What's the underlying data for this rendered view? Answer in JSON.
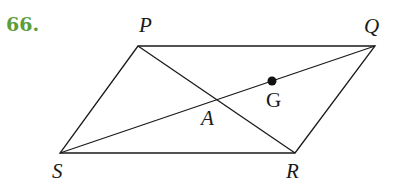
{
  "problem": {
    "number": "66.",
    "color": "#5a9e3a"
  },
  "diagram": {
    "type": "parallelogram with diagonals",
    "line_color": "#1a1a1a",
    "points": {
      "P": {
        "label": "P",
        "x": 138,
        "y": 46
      },
      "Q": {
        "label": "Q",
        "x": 375,
        "y": 46
      },
      "R": {
        "label": "R",
        "x": 295,
        "y": 153
      },
      "S": {
        "label": "S",
        "x": 60,
        "y": 153
      },
      "A": {
        "label": "A",
        "x": 217,
        "y": 100
      },
      "G": {
        "label": "G",
        "x": 272,
        "y": 81
      }
    },
    "segments": [
      "PQ",
      "QR",
      "RS",
      "SP",
      "PR",
      "SQ"
    ],
    "marked_point": "G"
  }
}
